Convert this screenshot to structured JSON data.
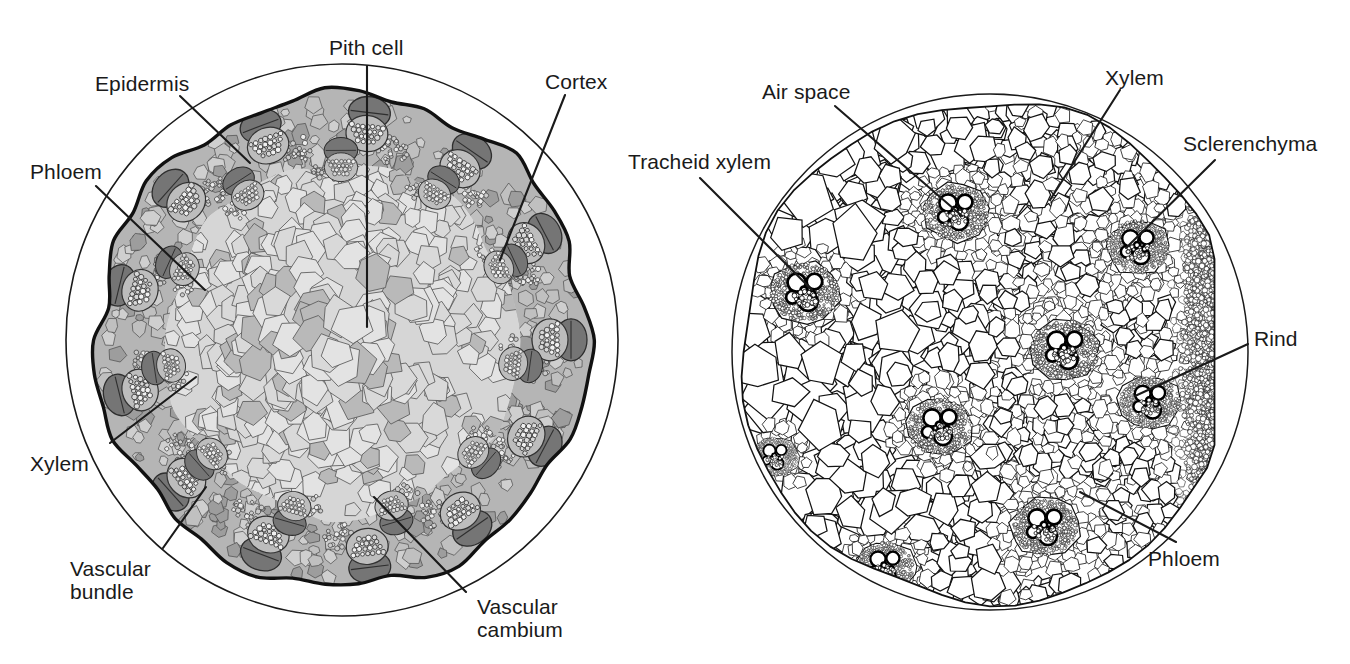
{
  "figure": {
    "panels": [
      {
        "id": "left",
        "name": "schematic-monocot-stem",
        "type": "schematic drawing",
        "labels": [
          {
            "key": "pith_cell",
            "text": "Pith cell",
            "x": 329,
            "y": 36,
            "align": "left"
          },
          {
            "key": "epidermis",
            "text": "Epidermis",
            "x": 95,
            "y": 72,
            "align": "left"
          },
          {
            "key": "cortex",
            "text": "Cortex",
            "x": 545,
            "y": 70,
            "align": "left"
          },
          {
            "key": "phloem",
            "text": "Phloem",
            "x": 30,
            "y": 160,
            "align": "left"
          },
          {
            "key": "xylem",
            "text": "Xylem",
            "x": 30,
            "y": 452,
            "align": "left"
          },
          {
            "key": "vascular_bundle",
            "text": "Vascular\nbundle",
            "x": 70,
            "y": 557,
            "align": "left"
          },
          {
            "key": "vascular_cambium",
            "text": "Vascular\ncambium",
            "x": 477,
            "y": 595,
            "align": "left"
          }
        ]
      },
      {
        "id": "right",
        "name": "micrograph-monocot-stem",
        "type": "line-art micrograph",
        "labels": [
          {
            "key": "air_space",
            "text": "Air space",
            "x": 762,
            "y": 80,
            "align": "left"
          },
          {
            "key": "xylem",
            "text": "Xylem",
            "x": 1105,
            "y": 66,
            "align": "left"
          },
          {
            "key": "tracheid_xylem",
            "text": "Tracheid xylem",
            "x": 628,
            "y": 150,
            "align": "left"
          },
          {
            "key": "sclerenchyma",
            "text": "Sclerenchyma",
            "x": 1183,
            "y": 132,
            "align": "left"
          },
          {
            "key": "rind",
            "text": "Rind",
            "x": 1254,
            "y": 327,
            "align": "left"
          },
          {
            "key": "phloem",
            "text": "Phloem",
            "x": 1148,
            "y": 547,
            "align": "left"
          }
        ]
      }
    ],
    "colors": {
      "ink": "#1a1a1a",
      "outline": "#000000",
      "cortex_fill": "#b5b5b5",
      "pith_fill": "#d6d6d6",
      "pith_cell_fill": "#dedede",
      "bundle_dark": "#757575",
      "bundle_mid": "#9a9a9a",
      "stipple": "#6e6e6e",
      "background": "#ffffff"
    }
  }
}
